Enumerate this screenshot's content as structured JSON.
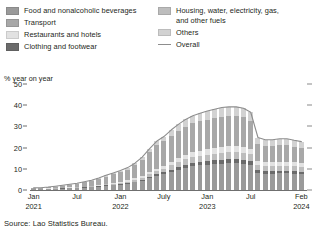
{
  "legend": {
    "left_column": [
      {
        "label": "Food and nonalcoholic beverages",
        "color": "#9a9a9a",
        "type": "swatch",
        "key": "food"
      },
      {
        "label": "Transport",
        "color": "#a8a8a8",
        "type": "swatch",
        "key": "transport"
      },
      {
        "label": "Restaurants and hotels",
        "color": "#e2e2e2",
        "type": "swatch",
        "key": "restaurants"
      },
      {
        "label": "Clothing and footwear",
        "color": "#6b6b6b",
        "type": "swatch",
        "key": "clothing"
      }
    ],
    "right_column": [
      {
        "label": "Housing, water, electricity, gas,\nand other fuels",
        "color": "#bdbdbd",
        "type": "swatch",
        "key": "housing"
      },
      {
        "label": "Others",
        "color": "#d2d2d2",
        "type": "swatch",
        "key": "others"
      },
      {
        "label": "Overall",
        "color": "#8d8d8d",
        "type": "line",
        "key": "overall"
      }
    ]
  },
  "axis_title": "% year on year",
  "source": "Source: Lao Statistics Bureau.",
  "ylabels": [
    "50",
    "40",
    "30",
    "20",
    "10",
    "0"
  ],
  "xlabels": [
    {
      "line1": "Jan",
      "line2": "2021",
      "index": 0
    },
    {
      "line1": "Jul",
      "line2": "",
      "index": 6
    },
    {
      "line1": "Jan",
      "line2": "2022",
      "index": 12
    },
    {
      "line1": "July",
      "line2": "",
      "index": 18
    },
    {
      "line1": "Jan",
      "line2": "2023",
      "index": 24
    },
    {
      "line1": "Jul",
      "line2": "",
      "index": 30
    },
    {
      "line1": "Feb",
      "line2": "2024",
      "index": 37
    }
  ],
  "chart_data": {
    "type": "bar",
    "stacked": true,
    "title": "",
    "xlabel": "",
    "ylabel": "% year on year",
    "ylim": [
      0,
      50
    ],
    "yticks": [
      0,
      10,
      20,
      30,
      40,
      50
    ],
    "grid": false,
    "legend_position": "top",
    "categories": [
      "Jan 2021",
      "Feb 2021",
      "Mar 2021",
      "Apr 2021",
      "May 2021",
      "Jun 2021",
      "Jul 2021",
      "Aug 2021",
      "Sep 2021",
      "Oct 2021",
      "Nov 2021",
      "Dec 2021",
      "Jan 2022",
      "Feb 2022",
      "Mar 2022",
      "Apr 2022",
      "May 2022",
      "Jun 2022",
      "Jul 2022",
      "Aug 2022",
      "Sep 2022",
      "Oct 2022",
      "Nov 2022",
      "Dec 2022",
      "Jan 2023",
      "Feb 2023",
      "Mar 2023",
      "Apr 2023",
      "May 2023",
      "Jun 2023",
      "Jul 2023",
      "Aug 2023",
      "Sep 2023",
      "Oct 2023",
      "Nov 2023",
      "Dec 2023",
      "Jan 2024",
      "Feb 2024"
    ],
    "series": [
      {
        "name": "Food and nonalcoholic beverages",
        "color": "#9a9a9a",
        "values": [
          0.4,
          0.4,
          0.5,
          0.6,
          0.7,
          0.8,
          0.9,
          1.1,
          1.3,
          1.6,
          2.0,
          2.3,
          2.6,
          3.0,
          3.6,
          4.4,
          5.6,
          6.6,
          7.4,
          8.6,
          9.6,
          10.5,
          11.2,
          11.6,
          11.9,
          12.2,
          12.5,
          12.6,
          12.6,
          12.4,
          11.8,
          7.9,
          7.6,
          7.6,
          7.8,
          7.8,
          7.6,
          7.4
        ]
      },
      {
        "name": "Clothing and footwear",
        "color": "#6b6b6b",
        "values": [
          0.05,
          0.05,
          0.06,
          0.07,
          0.08,
          0.09,
          0.1,
          0.12,
          0.14,
          0.17,
          0.2,
          0.24,
          0.28,
          0.33,
          0.4,
          0.5,
          0.62,
          0.76,
          0.9,
          1.05,
          1.2,
          1.35,
          1.45,
          1.55,
          1.65,
          1.75,
          1.85,
          1.9,
          1.92,
          1.9,
          1.82,
          1.35,
          1.3,
          1.3,
          1.32,
          1.32,
          1.28,
          1.25
        ]
      },
      {
        "name": "Housing, water, electricity, gas, and other fuels",
        "color": "#bdbdbd",
        "values": [
          0.1,
          0.1,
          0.12,
          0.14,
          0.16,
          0.18,
          0.2,
          0.24,
          0.28,
          0.34,
          0.42,
          0.5,
          0.58,
          0.68,
          0.82,
          1.0,
          1.25,
          1.5,
          1.75,
          2.05,
          2.35,
          2.6,
          2.8,
          2.95,
          3.1,
          3.2,
          3.3,
          3.35,
          3.38,
          3.35,
          3.2,
          2.4,
          2.3,
          2.3,
          2.35,
          2.35,
          2.28,
          2.22
        ]
      },
      {
        "name": "Restaurants and hotels",
        "color": "#e2e2e2",
        "values": [
          0.08,
          0.08,
          0.1,
          0.11,
          0.13,
          0.15,
          0.17,
          0.2,
          0.24,
          0.29,
          0.35,
          0.42,
          0.49,
          0.57,
          0.68,
          0.84,
          1.05,
          1.26,
          1.47,
          1.72,
          1.97,
          2.18,
          2.35,
          2.48,
          2.6,
          2.7,
          2.78,
          2.82,
          2.84,
          2.82,
          2.7,
          2.02,
          1.94,
          1.94,
          1.98,
          1.98,
          1.92,
          1.87
        ]
      },
      {
        "name": "Transport",
        "color": "#a8a8a8",
        "values": [
          0.25,
          0.3,
          0.45,
          0.7,
          1.0,
          1.3,
          1.55,
          1.9,
          2.3,
          2.8,
          3.4,
          3.95,
          4.45,
          5.1,
          6.1,
          7.5,
          9.3,
          10.9,
          11.4,
          12.2,
          12.8,
          13.3,
          13.6,
          13.8,
          14.0,
          14.1,
          14.2,
          14.2,
          14.1,
          13.8,
          13.0,
          8.0,
          7.6,
          7.6,
          7.7,
          7.7,
          7.4,
          7.2
        ]
      },
      {
        "name": "Others",
        "color": "#d2d2d2",
        "values": [
          0.12,
          0.12,
          0.15,
          0.18,
          0.2,
          0.23,
          0.26,
          0.31,
          0.37,
          0.45,
          0.55,
          0.65,
          0.75,
          0.88,
          1.05,
          1.3,
          1.62,
          1.95,
          2.28,
          2.66,
          3.05,
          3.37,
          3.63,
          3.82,
          4.0,
          4.15,
          4.27,
          4.33,
          4.36,
          4.33,
          4.15,
          3.1,
          2.98,
          2.98,
          3.04,
          3.04,
          2.95,
          2.87
        ]
      }
    ],
    "overall": {
      "name": "Overall",
      "color": "#8d8d8d",
      "values": [
        1.0,
        1.05,
        1.38,
        1.8,
        2.27,
        2.75,
        3.18,
        3.87,
        4.63,
        5.65,
        6.92,
        8.06,
        9.15,
        10.56,
        12.65,
        15.54,
        19.44,
        22.97,
        25.2,
        28.28,
        30.97,
        33.3,
        35.03,
        36.2,
        37.25,
        38.1,
        38.9,
        39.2,
        39.2,
        38.6,
        36.67,
        24.77,
        23.72,
        23.72,
        24.19,
        24.19,
        23.43,
        22.81
      ]
    }
  }
}
